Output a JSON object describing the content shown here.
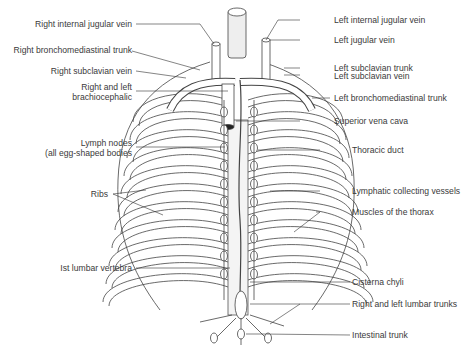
{
  "labels_left": [
    {
      "id": "right-internal-jugular-vein",
      "text": "Right internal jugular vein"
    },
    {
      "id": "right-bronchomediastinal-trunk",
      "text": "Right bronchomediastinal trunk"
    },
    {
      "id": "right-subclavian-vein",
      "text": "Right subclavian vein"
    },
    {
      "id": "right-left-brachiocephalic-1",
      "text": "Right and left"
    },
    {
      "id": "right-left-brachiocephalic-2",
      "text": "brachiocephalic"
    },
    {
      "id": "lymph-nodes-1",
      "text": "Lymph nodes"
    },
    {
      "id": "lymph-nodes-2",
      "text": "(all egg-shaped bodies"
    },
    {
      "id": "ribs",
      "text": "Ribs"
    },
    {
      "id": "first-lumbar-vertebra",
      "text": "Ist lumbar vertebra"
    }
  ],
  "labels_right": [
    {
      "id": "left-internal-jugular-vein",
      "text": "Left internal jugular vein"
    },
    {
      "id": "left-jugular-vein",
      "text": "Left jugular vein"
    },
    {
      "id": "left-subclavian-trunk",
      "text": "Left subclavian trunk"
    },
    {
      "id": "left-subclavian-vein",
      "text": "Left subclavian vein"
    },
    {
      "id": "left-bronchomediastinal-trunk",
      "text": "Left bronchomediastinal trunk"
    },
    {
      "id": "superior-vena-cava",
      "text": "Superior vena cava"
    },
    {
      "id": "thoracic-duct",
      "text": "Thoracic duct"
    },
    {
      "id": "lymphatic-collecting-vessels",
      "text": "Lymphatic collecting vessels"
    },
    {
      "id": "muscles-of-the-thorax",
      "text": "Muscles of the thorax"
    },
    {
      "id": "cisterna-chyli",
      "text": "Cisterna chyli"
    },
    {
      "id": "right-left-lumbar-trunks",
      "text": "Right and left lumbar trunks"
    },
    {
      "id": "intestinal-trunk",
      "text": "Intestinal trunk"
    }
  ]
}
